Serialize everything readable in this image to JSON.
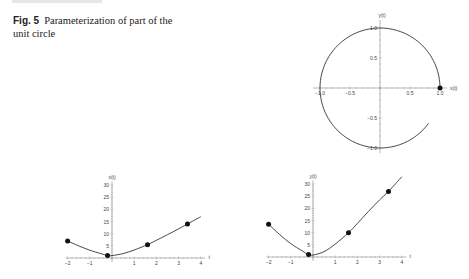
{
  "caption": {
    "label": "Fig. 5",
    "text": "Parameterization of part of the unit circle"
  },
  "chart_data": [
    {
      "type": "line",
      "title": "Unit circle arc (x(t), y(t))",
      "xlabel": "x(t)",
      "ylabel": "y(t)",
      "xlim": [
        -1.0,
        1.0
      ],
      "ylim": [
        -1.0,
        1.0
      ],
      "x_ticks": [
        "-1.0",
        "-0.5",
        "0.5",
        "1.0"
      ],
      "y_ticks": [
        "1.0",
        "0.5",
        "-0.5",
        "-1.0"
      ],
      "arc_start_angle_deg": 0,
      "arc_end_angle_deg": 324,
      "points": [
        {
          "x": 1.0,
          "y": 0.0
        }
      ],
      "grid": false
    },
    {
      "type": "line",
      "title": "x(t)",
      "xlabel": "t",
      "ylabel": "x(t)",
      "xlim": [
        -2,
        4
      ],
      "ylim": [
        0,
        30
      ],
      "x_ticks": [
        "-2",
        "-1",
        "1",
        "2",
        "3",
        "4"
      ],
      "y_ticks": [
        "5",
        "10",
        "15",
        "20",
        "25",
        "30"
      ],
      "curve": {
        "t": [
          -2,
          -1.5,
          -1,
          -0.5,
          -0.2,
          0,
          0.5,
          1,
          1.6,
          2,
          2.5,
          3,
          3.4,
          4
        ],
        "values": [
          7,
          5,
          3.2,
          1.8,
          1,
          1,
          1.8,
          3.3,
          5.5,
          7.3,
          9.6,
          12,
          14,
          17
        ]
      },
      "points": [
        {
          "t": -2,
          "value": 7
        },
        {
          "t": -0.2,
          "value": 1
        },
        {
          "t": 1.6,
          "value": 5.5
        },
        {
          "t": 3.4,
          "value": 14
        }
      ],
      "grid": false
    },
    {
      "type": "line",
      "title": "y(t)",
      "xlabel": "t",
      "ylabel": "y(t)",
      "xlim": [
        -2,
        4
      ],
      "ylim": [
        0,
        30
      ],
      "x_ticks": [
        "-2",
        "-1",
        "1",
        "2",
        "3",
        "4"
      ],
      "y_ticks": [
        "5",
        "10",
        "15",
        "20",
        "25",
        "30"
      ],
      "curve": {
        "t": [
          -2,
          -1.5,
          -1,
          -0.5,
          -0.2,
          0,
          0.5,
          1,
          1.6,
          2,
          2.5,
          3,
          3.4,
          4
        ],
        "values": [
          13.5,
          9.2,
          5.5,
          2.6,
          1,
          0.8,
          2.2,
          5.3,
          10,
          13.8,
          18.8,
          23.5,
          27,
          33
        ]
      },
      "points": [
        {
          "t": -2,
          "value": 13.5
        },
        {
          "t": -0.2,
          "value": 1
        },
        {
          "t": 1.6,
          "value": 10
        },
        {
          "t": 3.4,
          "value": 27
        }
      ],
      "grid": false
    }
  ]
}
